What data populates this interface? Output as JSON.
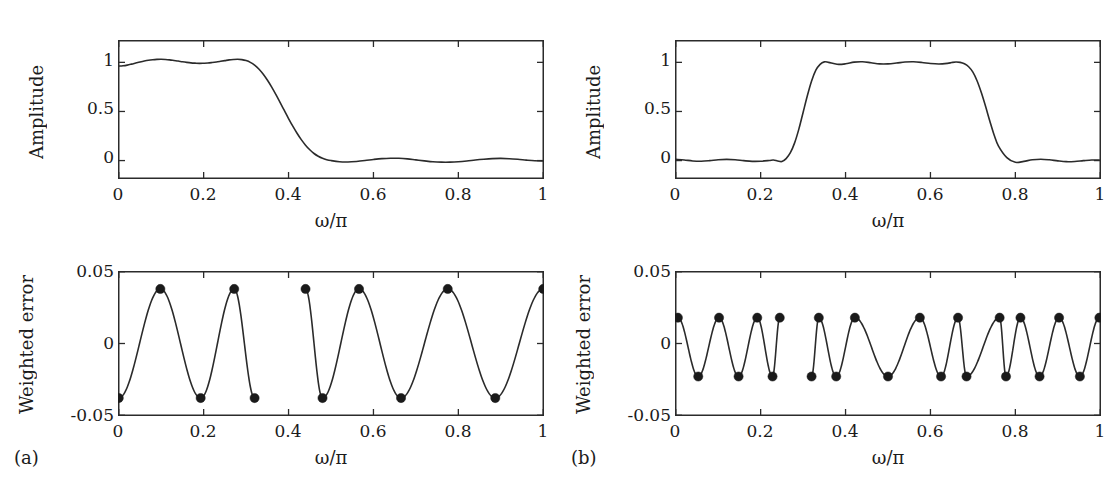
{
  "figure": {
    "background_color": "#ffffff",
    "line_color": "#2b2b2b",
    "marker_color": "#1a1a1a",
    "axis_color": "#2b2b2b",
    "panel_tags": [
      {
        "name": "a",
        "label": "(a)"
      },
      {
        "name": "b",
        "label": "(b)"
      }
    ]
  },
  "labels": {
    "amplitude": "Amplitude",
    "weighted_error": "Weighted error",
    "omega_over_pi": "ω/π"
  },
  "ticks": {
    "x_axis": [
      "0",
      "0.2",
      "0.4",
      "0.6",
      "0.8",
      "1"
    ],
    "x_values": [
      0,
      0.2,
      0.4,
      0.6,
      0.8,
      1
    ],
    "amplitude_y": [
      "0",
      "0.5",
      "1"
    ],
    "amplitude_y_values": [
      0,
      0.5,
      1
    ],
    "error_y": [
      "-0.05",
      "0",
      "0.05"
    ],
    "error_y_values": [
      -0.05,
      0,
      0.05
    ]
  },
  "chart_data": [
    {
      "id": "lowpass-amplitude",
      "type": "line",
      "title": "",
      "xlabel": "ω/π",
      "ylabel": "Amplitude",
      "xlim": [
        0,
        1
      ],
      "ylim": [
        -0.18,
        1.22
      ],
      "grid": false,
      "legend": "none",
      "x": [
        0,
        0.01,
        0.02,
        0.03,
        0.04,
        0.05,
        0.06,
        0.07,
        0.08,
        0.09,
        0.1,
        0.11,
        0.12,
        0.13,
        0.14,
        0.15,
        0.16,
        0.17,
        0.18,
        0.19,
        0.2,
        0.21,
        0.22,
        0.23,
        0.24,
        0.25,
        0.26,
        0.27,
        0.28,
        0.29,
        0.3,
        0.31,
        0.32,
        0.33,
        0.34,
        0.35,
        0.36,
        0.37,
        0.38,
        0.39,
        0.4,
        0.41,
        0.42,
        0.43,
        0.44,
        0.45,
        0.46,
        0.47,
        0.48,
        0.49,
        0.5,
        0.52,
        0.54,
        0.56,
        0.58,
        0.6,
        0.62,
        0.64,
        0.66,
        0.68,
        0.7,
        0.72,
        0.74,
        0.76,
        0.78,
        0.8,
        0.82,
        0.84,
        0.86,
        0.88,
        0.9,
        0.92,
        0.94,
        0.96,
        0.98,
        1.0
      ],
      "values": [
        0.962,
        0.965,
        0.972,
        0.982,
        0.993,
        1.004,
        1.014,
        1.022,
        1.027,
        1.03,
        1.031,
        1.029,
        1.025,
        1.019,
        1.013,
        1.006,
        1.0,
        0.995,
        0.992,
        0.99,
        0.991,
        0.993,
        0.998,
        1.004,
        1.011,
        1.018,
        1.025,
        1.029,
        1.031,
        1.028,
        1.018,
        1.0,
        0.972,
        0.932,
        0.881,
        0.82,
        0.75,
        0.673,
        0.592,
        0.51,
        0.428,
        0.35,
        0.278,
        0.213,
        0.157,
        0.11,
        0.072,
        0.044,
        0.023,
        0.009,
        0.0,
        -0.012,
        -0.014,
        -0.009,
        0.0,
        0.011,
        0.02,
        0.024,
        0.023,
        0.017,
        0.007,
        -0.003,
        -0.012,
        -0.016,
        -0.016,
        -0.012,
        -0.004,
        0.006,
        0.014,
        0.02,
        0.022,
        0.019,
        0.013,
        0.005,
        -0.002,
        -0.005
      ]
    },
    {
      "id": "lowpass-weighted-error",
      "type": "line",
      "title": "",
      "xlabel": "ω/π",
      "ylabel": "Weighted error",
      "xlim": [
        0,
        1
      ],
      "ylim": [
        -0.05,
        0.05
      ],
      "grid": false,
      "legend": "none",
      "ripple_amplitude": 0.038,
      "passband": [
        0,
        0.32
      ],
      "stopband": [
        0.44,
        1.0
      ],
      "transition_band": [
        0.32,
        0.44
      ],
      "extremal_points": [
        {
          "x": 0.0,
          "y": -0.038
        },
        {
          "x": 0.098,
          "y": 0.038
        },
        {
          "x": 0.193,
          "y": -0.038
        },
        {
          "x": 0.272,
          "y": 0.038
        },
        {
          "x": 0.32,
          "y": -0.038
        },
        {
          "x": 0.44,
          "y": 0.038
        },
        {
          "x": 0.48,
          "y": -0.038
        },
        {
          "x": 0.566,
          "y": 0.038
        },
        {
          "x": 0.665,
          "y": -0.038
        },
        {
          "x": 0.775,
          "y": 0.038
        },
        {
          "x": 0.887,
          "y": -0.038
        },
        {
          "x": 1.0,
          "y": 0.038
        }
      ]
    },
    {
      "id": "bandpass-amplitude",
      "type": "line",
      "title": "",
      "xlabel": "ω/π",
      "ylabel": "Amplitude",
      "xlim": [
        0,
        1
      ],
      "ylim": [
        -0.18,
        1.22
      ],
      "grid": false,
      "legend": "none",
      "x": [
        0,
        0.02,
        0.04,
        0.06,
        0.08,
        0.1,
        0.12,
        0.14,
        0.16,
        0.18,
        0.2,
        0.22,
        0.23,
        0.24,
        0.25,
        0.26,
        0.27,
        0.28,
        0.29,
        0.3,
        0.31,
        0.32,
        0.33,
        0.34,
        0.35,
        0.36,
        0.38,
        0.4,
        0.42,
        0.44,
        0.46,
        0.48,
        0.5,
        0.52,
        0.54,
        0.56,
        0.58,
        0.6,
        0.62,
        0.64,
        0.65,
        0.66,
        0.67,
        0.68,
        0.69,
        0.7,
        0.71,
        0.72,
        0.73,
        0.74,
        0.75,
        0.76,
        0.78,
        0.8,
        0.82,
        0.84,
        0.86,
        0.88,
        0.9,
        0.92,
        0.94,
        0.96,
        0.98,
        1.0
      ],
      "values": [
        0.013,
        0.006,
        -0.004,
        -0.007,
        -0.001,
        0.008,
        0.012,
        0.008,
        -0.001,
        -0.008,
        -0.007,
        0.001,
        0.006,
        -0.004,
        -0.01,
        0.02,
        0.08,
        0.18,
        0.32,
        0.49,
        0.66,
        0.81,
        0.92,
        0.98,
        1.005,
        1.0,
        0.98,
        0.985,
        1.002,
        1.006,
        0.996,
        0.985,
        0.985,
        0.993,
        1.003,
        1.006,
        0.999,
        0.988,
        0.983,
        0.99,
        0.998,
        1.004,
        1.0,
        0.985,
        0.955,
        0.9,
        0.81,
        0.69,
        0.55,
        0.4,
        0.26,
        0.15,
        0.03,
        -0.018,
        -0.008,
        0.008,
        0.014,
        0.008,
        -0.003,
        -0.011,
        -0.009,
        -0.001,
        0.006,
        0.004
      ]
    },
    {
      "id": "bandpass-weighted-error",
      "type": "line",
      "title": "",
      "xlabel": "ω/π",
      "ylabel": "Weighted error",
      "xlim": [
        0,
        1
      ],
      "ylim": [
        -0.05,
        0.05
      ],
      "grid": false,
      "legend": "none",
      "ripple_amplitude": 0.022,
      "bands": [
        [
          0,
          0.245
        ],
        [
          0.32,
          0.685
        ],
        [
          0.76,
          1.0
        ]
      ],
      "transition_bands": [
        [
          0.245,
          0.32
        ],
        [
          0.685,
          0.76
        ]
      ],
      "extremal_points": [
        {
          "x": 0.005,
          "y": 0.018
        },
        {
          "x": 0.053,
          "y": -0.023
        },
        {
          "x": 0.102,
          "y": 0.018
        },
        {
          "x": 0.148,
          "y": -0.023
        },
        {
          "x": 0.192,
          "y": 0.018
        },
        {
          "x": 0.228,
          "y": -0.023
        },
        {
          "x": 0.245,
          "y": 0.018
        },
        {
          "x": 0.32,
          "y": -0.023
        },
        {
          "x": 0.337,
          "y": 0.018
        },
        {
          "x": 0.378,
          "y": -0.023
        },
        {
          "x": 0.422,
          "y": 0.018
        },
        {
          "x": 0.5,
          "y": -0.023
        },
        {
          "x": 0.575,
          "y": 0.018
        },
        {
          "x": 0.625,
          "y": -0.023
        },
        {
          "x": 0.665,
          "y": 0.018
        },
        {
          "x": 0.685,
          "y": -0.023
        },
        {
          "x": 0.763,
          "y": 0.018
        },
        {
          "x": 0.778,
          "y": -0.023
        },
        {
          "x": 0.812,
          "y": 0.018
        },
        {
          "x": 0.857,
          "y": -0.023
        },
        {
          "x": 0.903,
          "y": 0.018
        },
        {
          "x": 0.952,
          "y": -0.023
        },
        {
          "x": 0.998,
          "y": 0.018
        }
      ]
    }
  ]
}
